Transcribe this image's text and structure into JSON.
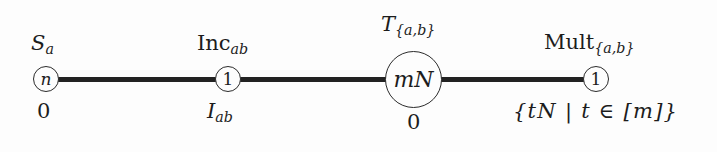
{
  "figure": {
    "type": "graph-diagram",
    "background_color": "#fdfdfd",
    "stroke_color": "#222222",
    "text_color": "#1c1c1c",
    "width": 717,
    "height": 152
  },
  "nodes": [
    {
      "id": "node-1",
      "inner_label": "n",
      "top_label_base": "S",
      "top_label_sub": "a",
      "bottom_label": "0",
      "shape": "circle",
      "size": "small"
    },
    {
      "id": "node-2",
      "inner_label": "1",
      "top_label_base": "Inc",
      "top_label_sub": "ab",
      "bottom_label_base": "I",
      "bottom_label_sub": "ab",
      "shape": "circle",
      "size": "small"
    },
    {
      "id": "node-3",
      "inner_label": "mN",
      "top_label_base": "T",
      "top_label_sub": "{a,b}",
      "bottom_label": "0",
      "shape": "circle",
      "size": "big"
    },
    {
      "id": "node-4",
      "inner_label": "1",
      "top_label_base": "Mult",
      "top_label_sub": "{a,b}",
      "bottom_label": "{tN | t ∈ [m]}",
      "shape": "circle",
      "size": "small"
    }
  ],
  "edges": [
    {
      "id": "edge-1-2",
      "from": "node-1",
      "to": "node-2"
    },
    {
      "id": "edge-2-3",
      "from": "node-2",
      "to": "node-3"
    },
    {
      "id": "edge-3-4",
      "from": "node-3",
      "to": "node-4"
    }
  ]
}
